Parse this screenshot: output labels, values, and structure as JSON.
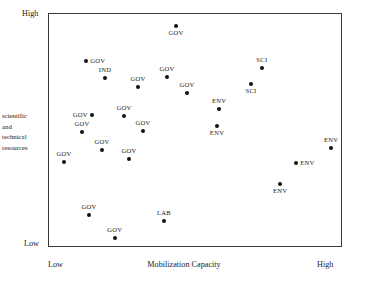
{
  "chart_data": {
    "type": "scatter",
    "title": "",
    "xlabel": "Mobilization Capacity",
    "ylabel": "scientific and technical resources",
    "ylabel_lines": [
      "scientific",
      "and",
      "technical",
      "resources"
    ],
    "xlim": [
      0,
      100
    ],
    "ylim": [
      0,
      100
    ],
    "grid": false,
    "legend": "none",
    "x_tick_labels": [
      "Low",
      "High"
    ],
    "y_tick_labels": [
      "Low",
      "High"
    ],
    "categories": [
      "GOV",
      "IND",
      "SCI",
      "ENV",
      "LAB"
    ],
    "points": [
      {
        "label": "GOV",
        "x": 43.2,
        "y": 94.9,
        "label_pos": "below"
      },
      {
        "label": "GOV",
        "x": 12.6,
        "y": 79.9,
        "label_pos": "right"
      },
      {
        "label": "IND",
        "x": 19.0,
        "y": 72.6,
        "label_pos": "above"
      },
      {
        "label": "GOV",
        "x": 30.3,
        "y": 68.8,
        "label_pos": "above"
      },
      {
        "label": "GOV",
        "x": 40.1,
        "y": 73.1,
        "label_pos": "above"
      },
      {
        "label": "GOV",
        "x": 46.9,
        "y": 66.2,
        "label_pos": "above"
      },
      {
        "label": "SCI",
        "x": 72.4,
        "y": 76.9,
        "label_pos": "above"
      },
      {
        "label": "SCI",
        "x": 68.7,
        "y": 70.1,
        "label_pos": "below"
      },
      {
        "label": "ENV",
        "x": 57.8,
        "y": 59.4,
        "label_pos": "above"
      },
      {
        "label": "ENV",
        "x": 57.1,
        "y": 52.1,
        "label_pos": "below"
      },
      {
        "label": "GOV",
        "x": 14.6,
        "y": 56.8,
        "label_pos": "left"
      },
      {
        "label": "GOV",
        "x": 25.5,
        "y": 56.4,
        "label_pos": "above"
      },
      {
        "label": "GOV",
        "x": 32.0,
        "y": 50.0,
        "label_pos": "above"
      },
      {
        "label": "GOV",
        "x": 11.2,
        "y": 49.6,
        "label_pos": "above"
      },
      {
        "label": "ENV",
        "x": 95.9,
        "y": 42.7,
        "label_pos": "above"
      },
      {
        "label": "GOV",
        "x": 18.0,
        "y": 41.9,
        "label_pos": "above"
      },
      {
        "label": "GOV",
        "x": 27.2,
        "y": 38.0,
        "label_pos": "above"
      },
      {
        "label": "GOV",
        "x": 5.1,
        "y": 36.8,
        "label_pos": "above"
      },
      {
        "label": "ENV",
        "x": 84.0,
        "y": 36.3,
        "label_pos": "right"
      },
      {
        "label": "ENV",
        "x": 78.6,
        "y": 27.4,
        "label_pos": "below"
      },
      {
        "label": "GOV",
        "x": 13.6,
        "y": 14.1,
        "label_pos": "above"
      },
      {
        "label": "LAB",
        "x": 39.1,
        "y": 11.5,
        "label_pos": "above"
      },
      {
        "label": "GOV",
        "x": 22.4,
        "y": 4.3,
        "label_pos": "above"
      }
    ]
  },
  "axes": {
    "y_high": "High",
    "y_low": "Low",
    "x_low": "Low",
    "x_high": "High",
    "x_title": "Mobilization Capacity",
    "y_title_lines": [
      "scientific",
      "and",
      "technical",
      "resources"
    ]
  },
  "colors": {
    "point": "#111111",
    "frame": "#3a3a3a",
    "text": "#1a1a1a",
    "background": "#ffffff"
  }
}
